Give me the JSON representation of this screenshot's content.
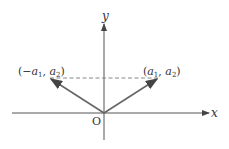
{
  "diagram": {
    "axes": {
      "x_label": "x",
      "y_label": "y",
      "origin_label": "O"
    },
    "points": [
      {
        "name": "left-point",
        "label": {
          "open": "(−",
          "a": "a",
          "sub1": "1",
          "comma": ", ",
          "b": "a",
          "sub2": "2",
          "close": ")"
        }
      },
      {
        "name": "right-point",
        "label": {
          "open": "(",
          "a": "a",
          "sub1": "1",
          "comma": ", ",
          "b": "a",
          "sub2": "2",
          "close": ")"
        }
      }
    ],
    "colors": {
      "axis": "#444444",
      "vector": "#555555",
      "dashed": "#777777",
      "text": "#333333"
    }
  }
}
